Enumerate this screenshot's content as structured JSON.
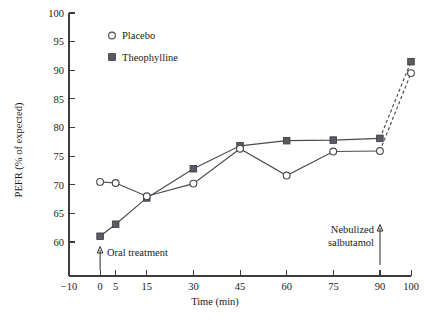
{
  "chart_data": {
    "type": "line",
    "title": "",
    "xlabel": "Time (min)",
    "ylabel": "PEFR (% of expected)",
    "xlim": [
      -10,
      100
    ],
    "ylim": [
      56,
      100
    ],
    "grid": false,
    "legend_position": "top-left-inside",
    "x_ticks": [
      -10,
      0,
      5,
      15,
      30,
      45,
      60,
      75,
      90,
      100
    ],
    "x_tick_labels": [
      "−10",
      "0",
      "5",
      "15",
      "30",
      "45",
      "60",
      "75",
      "90",
      "100"
    ],
    "y_ticks": [
      60,
      65,
      70,
      75,
      80,
      85,
      90,
      95,
      100
    ],
    "y_tick_labels": [
      "60",
      "65",
      "70",
      "75",
      "80",
      "85",
      "90",
      "95",
      "100"
    ],
    "x": [
      0,
      5,
      15,
      30,
      45,
      60,
      75,
      90,
      100
    ],
    "series": [
      {
        "name": "Placebo",
        "marker": "open-circle",
        "values": [
          70.5,
          70.3,
          68.0,
          70.2,
          76.3,
          71.6,
          75.8,
          75.9,
          89.5
        ],
        "dashed_from_index": 7
      },
      {
        "name": "Theophylline",
        "marker": "filled-square",
        "values": [
          61.0,
          63.1,
          67.7,
          72.8,
          76.8,
          77.7,
          77.8,
          78.1,
          91.5
        ],
        "dashed_from_index": 7
      }
    ],
    "annotations": [
      {
        "id": "oral-treatment",
        "text": "Oral treatment",
        "x": 0,
        "arrow": "up",
        "arrow_at_x": 0
      },
      {
        "id": "nebulized-salbutamol",
        "line1": "Nebulized",
        "line2": "salbutamol",
        "x": 90,
        "arrow": "up",
        "arrow_at_x": 90
      }
    ]
  },
  "legend": {
    "items": [
      {
        "label": "Placebo",
        "marker": "open-circle"
      },
      {
        "label": "Theophylline",
        "marker": "filled-square"
      }
    ]
  },
  "axes": {
    "y_title": "PEFR (% of expected)",
    "x_title": "Time (min)"
  },
  "colors": {
    "line": "#4a4a52",
    "marker_fill": "#5a5a62",
    "axis": "#3c3c3c",
    "text": "#1a1a1a",
    "background": "#ffffff"
  },
  "caption": {
    "text": ""
  }
}
